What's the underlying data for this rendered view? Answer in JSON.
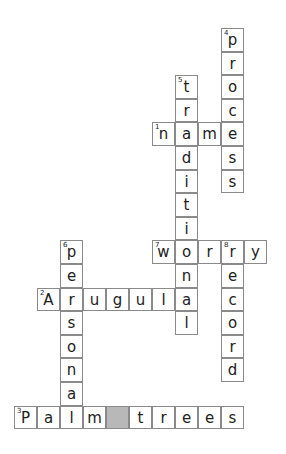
{
  "puzzle": {
    "grid_origin": {
      "x": 14,
      "y": 28
    },
    "cell_size": {
      "w": 23,
      "h": 23.6
    },
    "colors": {
      "border": "#8a8a8a",
      "blocked": "#b8b8b8",
      "text": "#222222",
      "background": "#ffffff"
    },
    "words": [
      {
        "number": "1",
        "direction": "across",
        "answer": "name",
        "row": 4,
        "col": 6
      },
      {
        "number": "2",
        "direction": "across",
        "answer": "Arugula",
        "row": 11,
        "col": 1
      },
      {
        "number": "3",
        "direction": "across",
        "answer": "Palm trees",
        "row": 16,
        "col": 0
      },
      {
        "number": "4",
        "direction": "down",
        "answer": "process",
        "row": 0,
        "col": 9
      },
      {
        "number": "5",
        "direction": "down",
        "answer": "traditional",
        "row": 2,
        "col": 7
      },
      {
        "number": "6",
        "direction": "down",
        "answer": "persona",
        "row": 9,
        "col": 2
      },
      {
        "number": "7",
        "direction": "across",
        "answer": "worry",
        "row": 9,
        "col": 6
      },
      {
        "number": "8",
        "direction": "down",
        "answer": "record",
        "row": 9,
        "col": 9
      }
    ]
  }
}
